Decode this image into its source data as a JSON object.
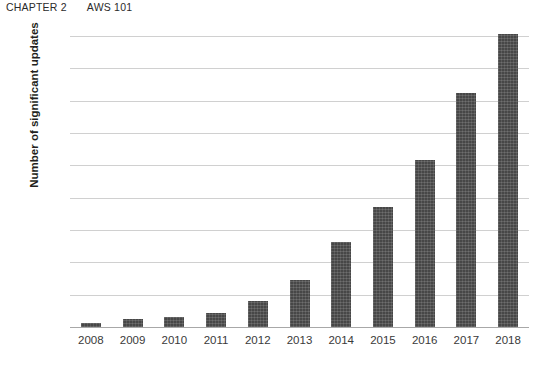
{
  "header": {
    "chapter_number": "CHAPTER 2",
    "chapter_title": "AWS 101"
  },
  "chart_data": {
    "type": "bar",
    "title": "",
    "xlabel": "",
    "ylabel": "Number of significant updates",
    "categories": [
      "2008",
      "2009",
      "2010",
      "2011",
      "2012",
      "2013",
      "2014",
      "2015",
      "2016",
      "2017",
      "2018"
    ],
    "values": [
      25,
      50,
      65,
      85,
      160,
      290,
      525,
      740,
      1030,
      1450,
      1810
    ],
    "ylim": [
      0,
      1800
    ],
    "ytick_labels": [
      "0",
      "200",
      "400",
      "600",
      "800",
      "1000",
      "1200",
      "1400",
      "1600",
      "1800"
    ],
    "ytick_values": [
      0,
      200,
      400,
      600,
      800,
      1000,
      1200,
      1400,
      1600,
      1800
    ],
    "grid": true,
    "legend": "none",
    "bar_color": "#474747",
    "gridline_color": "#d0d0d0",
    "axis_color": "#a8a8a8",
    "background": "#ffffff"
  }
}
